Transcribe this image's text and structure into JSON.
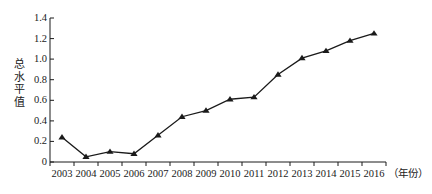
{
  "chart_data": {
    "type": "line",
    "title": "",
    "subtitle": "",
    "xlabel": "（年份）",
    "ylabel": "总水平值",
    "categories": [
      "2003",
      "2004",
      "2005",
      "2006",
      "2007",
      "2008",
      "2009",
      "2010",
      "2011",
      "2012",
      "2013",
      "2014",
      "2015",
      "2016"
    ],
    "x": [
      2003,
      2004,
      2005,
      2006,
      2007,
      2008,
      2009,
      2010,
      2011,
      2012,
      2013,
      2014,
      2015,
      2016
    ],
    "values": [
      0.24,
      0.05,
      0.1,
      0.08,
      0.26,
      0.44,
      0.5,
      0.61,
      0.63,
      0.85,
      1.01,
      1.08,
      1.18,
      1.25
    ],
    "series": [
      {
        "name": "总水平值",
        "values": [
          0.24,
          0.05,
          0.1,
          0.08,
          0.26,
          0.44,
          0.5,
          0.61,
          0.63,
          0.85,
          1.01,
          1.08,
          1.18,
          1.25
        ]
      }
    ],
    "ylim": [
      0,
      1.4
    ],
    "xlim": [
      2003,
      2016
    ],
    "ytick_labels": [
      "0",
      "0.2",
      "0.4",
      "0.6",
      "0.8",
      "1.0",
      "1.2",
      "1.4"
    ],
    "ytick_values": [
      0,
      0.2,
      0.4,
      0.6,
      0.8,
      1.0,
      1.2,
      1.4
    ],
    "grid": false,
    "legend": false,
    "legend_position": "none",
    "marker": "triangle",
    "line_color": "#1a1a1a",
    "marker_color": "#1a1a1a",
    "axis_color": "#1a1a1a",
    "background": "#ffffff"
  },
  "axes": {
    "y_title_chars": "总\n水\n平\n值",
    "x_title": "（年份）"
  }
}
